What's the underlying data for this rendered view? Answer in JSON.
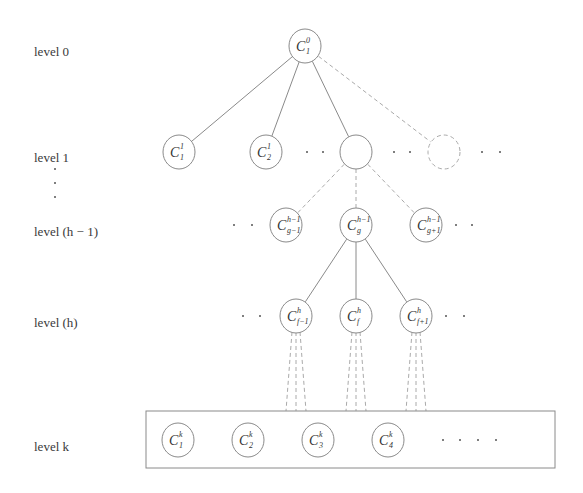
{
  "diagram": {
    "type": "hierarchical-tree",
    "levels": [
      {
        "id": "level-0",
        "label": "level 0",
        "y": 52
      },
      {
        "id": "level-1",
        "label": "level 1",
        "y": 158
      },
      {
        "id": "level-h-1",
        "label": "level (h − 1)",
        "y": 232
      },
      {
        "id": "level-h",
        "label": "level (h)",
        "y": 323
      },
      {
        "id": "level-k",
        "label": "level k",
        "y": 447
      }
    ],
    "vertical_ellipsis": "⋮",
    "nodes": [
      {
        "id": "C1_0",
        "base": "C",
        "sup": "0",
        "sub": "1",
        "cx": 305,
        "cy": 46,
        "style": "solid"
      },
      {
        "id": "C1_1",
        "base": "C",
        "sup": "1",
        "sub": "1",
        "cx": 179,
        "cy": 152,
        "style": "solid"
      },
      {
        "id": "C2_1",
        "base": "C",
        "sup": "1",
        "sub": "2",
        "cx": 266,
        "cy": 152,
        "style": "solid"
      },
      {
        "id": "blank_1",
        "base": "",
        "sup": "",
        "sub": "",
        "cx": 356,
        "cy": 152,
        "style": "solid"
      },
      {
        "id": "dashed_1",
        "base": "",
        "sup": "",
        "sub": "",
        "cx": 444,
        "cy": 152,
        "style": "dashed"
      },
      {
        "id": "Cg-1_h-1",
        "base": "C",
        "sup": "h−1",
        "sub": "g−1",
        "cx": 286,
        "cy": 225,
        "style": "solid"
      },
      {
        "id": "Cg_h-1",
        "base": "C",
        "sup": "h−1",
        "sub": "g",
        "cx": 356,
        "cy": 225,
        "style": "solid"
      },
      {
        "id": "Cg+1_h-1",
        "base": "C",
        "sup": "h−1",
        "sub": "g+1",
        "cx": 426,
        "cy": 225,
        "style": "solid"
      },
      {
        "id": "Cf-1_h",
        "base": "C",
        "sup": "h",
        "sub": "f−1",
        "cx": 296,
        "cy": 316,
        "style": "solid"
      },
      {
        "id": "Cf_h",
        "base": "C",
        "sup": "h",
        "sub": "f",
        "cx": 356,
        "cy": 316,
        "style": "solid"
      },
      {
        "id": "Cf+1_h",
        "base": "C",
        "sup": "h",
        "sub": "f+1",
        "cx": 416,
        "cy": 316,
        "style": "solid"
      },
      {
        "id": "C1_k",
        "base": "C",
        "sup": "k",
        "sub": "1",
        "cx": 178,
        "cy": 440,
        "style": "solid"
      },
      {
        "id": "C2_k",
        "base": "C",
        "sup": "k",
        "sub": "2",
        "cx": 248,
        "cy": 440,
        "style": "solid"
      },
      {
        "id": "C3_k",
        "base": "C",
        "sup": "k",
        "sub": "3",
        "cx": 318,
        "cy": 440,
        "style": "solid"
      },
      {
        "id": "C4_k",
        "base": "C",
        "sup": "k",
        "sub": "4",
        "cx": 388,
        "cy": 440,
        "style": "solid"
      }
    ],
    "edges": [
      {
        "from": "C1_0",
        "to": "C1_1",
        "style": "solid"
      },
      {
        "from": "C1_0",
        "to": "C2_1",
        "style": "solid"
      },
      {
        "from": "C1_0",
        "to": "blank_1",
        "style": "solid"
      },
      {
        "from": "C1_0",
        "to": "dashed_1",
        "style": "dashed"
      },
      {
        "from": "blank_1",
        "to": "Cg-1_h-1",
        "style": "dashed"
      },
      {
        "from": "blank_1",
        "to": "Cg_h-1",
        "style": "dashed"
      },
      {
        "from": "blank_1",
        "to": "Cg+1_h-1",
        "style": "dashed"
      },
      {
        "from": "Cg_h-1",
        "to": "Cf-1_h",
        "style": "solid"
      },
      {
        "from": "Cg_h-1",
        "to": "Cf_h",
        "style": "solid"
      },
      {
        "from": "Cg_h-1",
        "to": "Cf+1_h",
        "style": "solid"
      }
    ],
    "fan_to_level_k": {
      "from": [
        "Cf-1_h",
        "Cf_h",
        "Cf+1_h"
      ],
      "lines_per_node": 3,
      "style": "dashed"
    },
    "ellipses": [
      {
        "level": "level-1",
        "x": [
          307,
          323
        ],
        "y": 152
      },
      {
        "level": "level-1",
        "x": [
          394,
          410
        ],
        "y": 152
      },
      {
        "level": "level-1",
        "x": [
          482,
          500
        ],
        "y": 152
      },
      {
        "level": "level-h-1",
        "x": [
          234,
          252
        ],
        "y": 225
      },
      {
        "level": "level-h-1",
        "x": [
          456,
          472
        ],
        "y": 225
      },
      {
        "level": "level-h",
        "x": [
          243,
          260
        ],
        "y": 316
      },
      {
        "level": "level-h",
        "x": [
          446,
          464
        ],
        "y": 316
      },
      {
        "level": "level-k",
        "x": [
          443,
          460,
          478,
          496
        ],
        "y": 440
      }
    ],
    "level_k_box": {
      "x": 146,
      "y": 411,
      "w": 409,
      "h": 57
    },
    "colors": {
      "stroke": "#8a8a8a",
      "text": "#333333",
      "dashed": "#aaaaaa"
    }
  }
}
